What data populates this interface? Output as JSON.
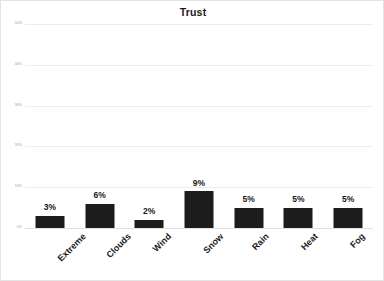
{
  "chart_data": {
    "type": "bar",
    "title": "Trust",
    "xlabel": "",
    "ylabel": "",
    "categories": [
      "Extreme",
      "Clouds",
      "Wind",
      "Snow",
      "Rain",
      "Heat",
      "Fog"
    ],
    "values": [
      3,
      6,
      2,
      9,
      5,
      5,
      5
    ],
    "value_labels": [
      "3%",
      "6%",
      "2%",
      "9%",
      "5%",
      "5%",
      "5%"
    ],
    "ylim": [
      0,
      50
    ],
    "ytick_values": [
      50,
      40,
      30,
      20,
      10,
      0
    ],
    "ytick_labels": [
      "50%",
      "40%",
      "30%",
      "20%",
      "10%",
      "0%"
    ],
    "grid": true,
    "legend": false,
    "legend_position": "none",
    "bar_color": "#1c1c1c",
    "gridline_color": "#ededed",
    "background_color": "#ffffff",
    "title_color": "#1a1a1a"
  }
}
